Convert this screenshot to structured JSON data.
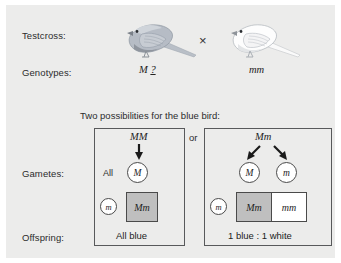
{
  "figure": {
    "background_color": "#ececeb",
    "blue_swatch_color": "#bfbfbf",
    "white_swatch_color": "#ffffff",
    "line_color": "#58595b"
  },
  "row_labels": {
    "testcross": "Testcross:",
    "genotypes": "Genotypes:",
    "gametes": "Gametes:",
    "offspring": "Offspring:"
  },
  "parents": {
    "left": {
      "bird_name": "blue-bird",
      "bird_color": "#a9b0ba",
      "genotype_symbol": "M",
      "genotype_unknown": "?"
    },
    "cross_symbol": "×",
    "right": {
      "bird_name": "white-bird",
      "bird_color": "#fbfbfb",
      "genotype": "mm"
    }
  },
  "heading": "Two possibilities for the blue bird:",
  "separator": "or",
  "possibility_left": {
    "parent_genotype": "MM",
    "gamete_all_label": "All",
    "gamete_allele": "M",
    "tester_gamete": "m",
    "punnett_cells": [
      {
        "genotype": "Mm",
        "phenotype": "blue"
      }
    ],
    "offspring_result": "All blue"
  },
  "possibility_right": {
    "parent_genotype": "Mm",
    "gamete_alleles": [
      "M",
      "m"
    ],
    "tester_gamete": "m",
    "punnett_cells": [
      {
        "genotype": "Mm",
        "phenotype": "blue"
      },
      {
        "genotype": "mm",
        "phenotype": "white"
      }
    ],
    "offspring_result": "1 blue : 1 white"
  }
}
